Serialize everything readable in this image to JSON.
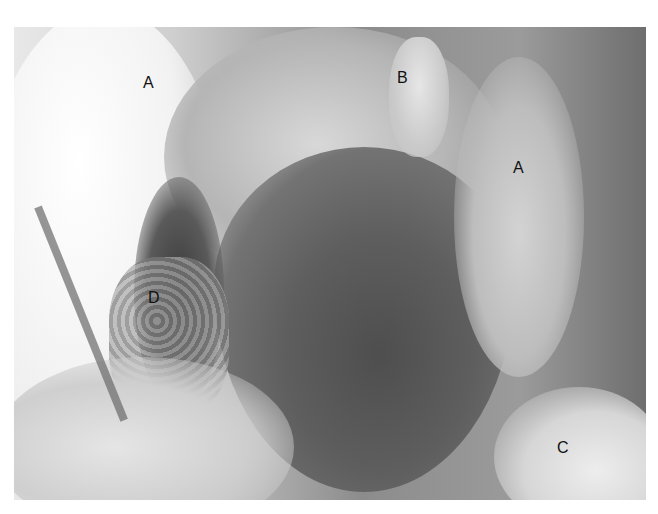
{
  "figure": {
    "labels": [
      {
        "text": "A",
        "x": 150,
        "y": 83
      },
      {
        "text": "B",
        "x": 403,
        "y": 78
      },
      {
        "text": "A",
        "x": 519,
        "y": 168
      },
      {
        "text": "D",
        "x": 155,
        "y": 298
      },
      {
        "text": "C",
        "x": 563,
        "y": 448
      }
    ]
  }
}
